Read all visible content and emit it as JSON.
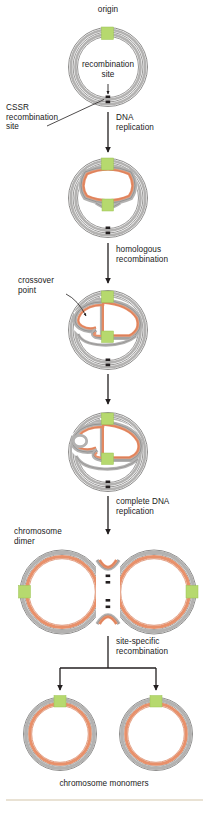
{
  "figure": {
    "width": 209,
    "height": 814
  },
  "colors": {
    "dna_grey": "#b3b2b1",
    "dna_grey_dark": "#8e8d8c",
    "dna_orange": "#e8906a",
    "dna_orange_dark": "#d4764f",
    "origin_green": "#b6d96e",
    "origin_green_dark": "#9cc455",
    "cssr_marker": "#231f20",
    "arrow": "#231f20",
    "text": "#1a1a1a",
    "rule": "#e2d8c6",
    "background": "#ffffff"
  },
  "labels": {
    "origin": "origin",
    "recombination_site": "recombination\nsite",
    "cssr_recombination_site": "CSSR\nrecombination\nsite",
    "crossover_point": "crossover\npoint",
    "chromosome_dimer": "chromosome\ndimer",
    "chromosome_monomers": "chromosome monomers"
  },
  "steps": [
    {
      "id": "step-dna-replication",
      "label": "DNA\nreplication",
      "arrow": "down"
    },
    {
      "id": "step-homologous-recombination",
      "label": "homologous\nrecombination",
      "arrow": "down"
    },
    {
      "id": "step-unlabeled-transition",
      "label": "",
      "arrow": "down"
    },
    {
      "id": "step-complete-dna-replication",
      "label": "complete DNA\nreplication",
      "arrow": "down"
    },
    {
      "id": "step-site-specific-recombination",
      "label": "site-specific\nrecombination",
      "arrow": "split-down"
    }
  ],
  "stages": [
    {
      "id": "stage-1-circular-chromosome",
      "name": "circular chromosome",
      "strands": "double-grey",
      "origin_markers": 1,
      "cssr_markers": 2
    },
    {
      "id": "stage-2-theta-replication",
      "name": "theta replication intermediate",
      "strands": "grey-with-orange-bubble",
      "origin_markers": 2,
      "cssr_markers": 2
    },
    {
      "id": "stage-3-crossover",
      "name": "homologous recombination crossover",
      "strands": "grey-with-orange-crossed-bubble",
      "origin_markers": 2,
      "cssr_markers": 2
    },
    {
      "id": "stage-4-crossover-resolved",
      "name": "crossover resolved intermediate",
      "strands": "grey-with-orange-crossed-bubble",
      "origin_markers": 2,
      "cssr_markers": 2
    },
    {
      "id": "stage-5-chromosome-dimer",
      "name": "chromosome dimer figure-eight",
      "strands": "grey-orange-double",
      "origin_markers": 2,
      "cssr_markers": 4
    },
    {
      "id": "stage-6-monomer-left",
      "name": "chromosome monomer left",
      "strands": "grey-orange-double",
      "origin_markers": 1,
      "cssr_markers": 0
    },
    {
      "id": "stage-7-monomer-right",
      "name": "chromosome monomer right",
      "strands": "grey-orange-double",
      "origin_markers": 1,
      "cssr_markers": 0
    }
  ]
}
